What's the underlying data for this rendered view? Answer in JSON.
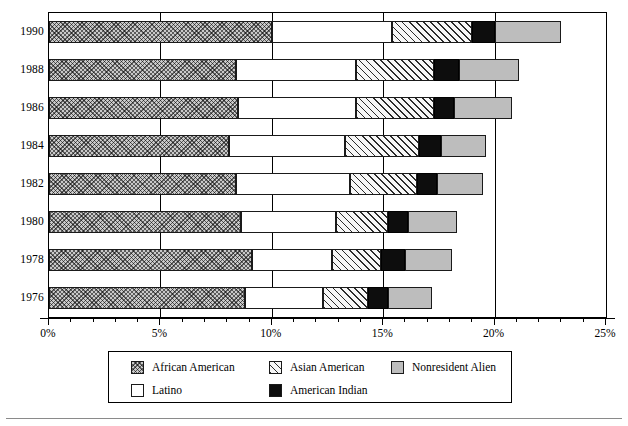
{
  "chart_data": {
    "type": "bar",
    "orientation": "horizontal",
    "stacked": true,
    "title": "",
    "subtitle": "",
    "xlabel": "",
    "ylabel": "",
    "xlim": [
      0,
      25
    ],
    "xunit": "%",
    "grid": true,
    "legend_position": "bottom",
    "categories": [
      "1990",
      "1988",
      "1986",
      "1984",
      "1982",
      "1980",
      "1978",
      "1976"
    ],
    "tick_labels": [
      "0%",
      "5%",
      "10%",
      "15%",
      "20%",
      "25%"
    ],
    "tick_values": [
      0,
      5,
      10,
      15,
      20,
      25
    ],
    "minor_tick_step": 1,
    "series": [
      {
        "name": "African American",
        "swatch": "african-american",
        "color": "#c9c9c9",
        "values": [
          10.0,
          8.4,
          8.5,
          8.1,
          8.4,
          8.6,
          9.1,
          8.8
        ]
      },
      {
        "name": "Latino",
        "swatch": "latino",
        "color": "#ffffff",
        "values": [
          5.4,
          5.4,
          5.3,
          5.2,
          5.1,
          4.3,
          3.6,
          3.5
        ]
      },
      {
        "name": "Asian American",
        "swatch": "asian-american",
        "color": "#f2f2f2",
        "values": [
          3.6,
          3.5,
          3.5,
          3.3,
          3.0,
          2.3,
          2.2,
          2.0
        ]
      },
      {
        "name": "American Indian",
        "swatch": "american-indian",
        "color": "#0d0d0d",
        "values": [
          1.0,
          1.1,
          0.9,
          1.0,
          0.9,
          0.9,
          1.1,
          0.9
        ]
      },
      {
        "name": "Nonresident Alien",
        "swatch": "nonresident-alien",
        "color": "#bdbdbd",
        "values": [
          3.0,
          2.7,
          2.6,
          2.0,
          2.1,
          2.2,
          2.1,
          2.0
        ]
      }
    ],
    "totals": [
      23.0,
      21.1,
      20.8,
      19.6,
      19.5,
      18.3,
      18.1,
      17.2
    ]
  },
  "legend": {
    "items": [
      {
        "label": "African American",
        "swatch": "african-american"
      },
      {
        "label": "Asian American",
        "swatch": "asian-american"
      },
      {
        "label": "Nonresident Alien",
        "swatch": "nonresident-alien"
      },
      {
        "label": "Latino",
        "swatch": "latino"
      },
      {
        "label": "American Indian",
        "swatch": "american-indian"
      }
    ]
  }
}
